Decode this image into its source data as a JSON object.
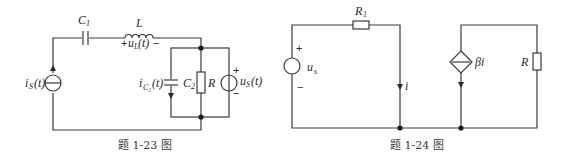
{
  "figures": [
    {
      "id": "fig-1-23",
      "caption": "题 1-23 图",
      "components": {
        "C1": {
          "label": "C",
          "sub": "1"
        },
        "L": {
          "label": "L",
          "voltage_label": "u",
          "voltage_sub": "L",
          "voltage_arg": "(t)",
          "plus": "+",
          "minus": "−"
        },
        "is": {
          "label": "i",
          "sub": "S",
          "arg": "(t)"
        },
        "C2": {
          "label": "C",
          "sub": "2",
          "current_label": "i",
          "current_sub": "C₂",
          "current_arg": "(t)"
        },
        "R": {
          "label": "R"
        },
        "us": {
          "label": "u",
          "sub": "S",
          "arg": "(t)",
          "plus": "+",
          "minus": "−"
        }
      }
    },
    {
      "id": "fig-1-24",
      "caption": "题 1-24 图",
      "components": {
        "R1": {
          "label": "R",
          "sub": "1"
        },
        "us": {
          "label": "u",
          "sub": "s",
          "plus": "+",
          "minus": "−"
        },
        "i": {
          "label": "i"
        },
        "dep_source": {
          "label": "βi"
        },
        "R": {
          "label": "R"
        }
      }
    }
  ]
}
